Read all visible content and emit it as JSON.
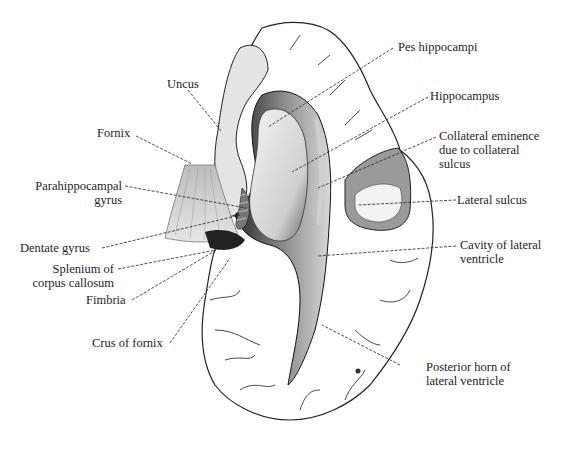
{
  "diagram": {
    "labels_left": [
      {
        "id": "uncus",
        "text": "Uncus"
      },
      {
        "id": "fornix",
        "text": "Fornix"
      },
      {
        "id": "parahippocampal",
        "line1": "Parahippocampal",
        "line2": "gyrus"
      },
      {
        "id": "dentate",
        "text": "Dentate gyrus"
      },
      {
        "id": "splenium",
        "line1": "Splenium of",
        "line2": "corpus callosum"
      },
      {
        "id": "fimbria",
        "text": "Fimbria"
      },
      {
        "id": "crus",
        "text": "Crus of fornix"
      }
    ],
    "labels_right": [
      {
        "id": "pes",
        "text": "Pes hippocampi"
      },
      {
        "id": "hippocampus",
        "text": "Hippocampus"
      },
      {
        "id": "collateral",
        "line1": "Collateral eminence",
        "line2": "due to collateral",
        "line3": "sulcus"
      },
      {
        "id": "lateral_sulcus",
        "text": "Lateral sulcus"
      },
      {
        "id": "cavity",
        "line1": "Cavity of lateral",
        "line2": "ventricle"
      },
      {
        "id": "posterior_horn",
        "line1": "Posterior horn of",
        "line2": "lateral ventricle"
      }
    ]
  }
}
